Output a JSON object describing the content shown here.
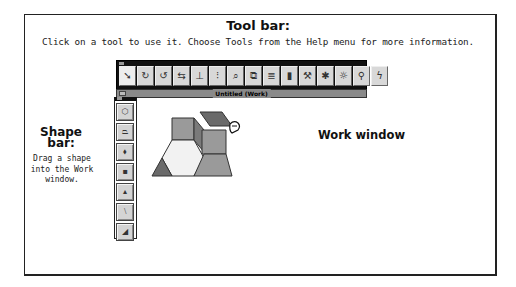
{
  "toolbar_callout": {
    "title": "Tool bar:",
    "description": "Click on a tool to use it.  Choose Tools from the Help menu for more information."
  },
  "toolbar_window": {
    "tools": [
      {
        "name": "arrow-tool",
        "glyph": "➘"
      },
      {
        "name": "rotate-right-tool",
        "glyph": "↻"
      },
      {
        "name": "rotate-left-tool",
        "glyph": "↺"
      },
      {
        "name": "flip-tool",
        "glyph": "⇆"
      },
      {
        "name": "slide-tool",
        "glyph": "⊥"
      },
      {
        "name": "glue-tool",
        "glyph": "⁝"
      },
      {
        "name": "magnify-tool",
        "glyph": "⌕"
      },
      {
        "name": "copy-tool",
        "glyph": "⧉"
      },
      {
        "name": "ruler-tool",
        "glyph": "≣"
      },
      {
        "name": "trash-tool",
        "glyph": "▮"
      },
      {
        "name": "hammer-tool",
        "glyph": "⚒"
      },
      {
        "name": "sparkle-tool",
        "glyph": "✱"
      },
      {
        "name": "sun-tool",
        "glyph": "☼"
      },
      {
        "name": "figure-tool",
        "glyph": "⚲"
      },
      {
        "name": "lightning-tool",
        "glyph": "ϟ"
      }
    ]
  },
  "work_window": {
    "title": "Untitled (Work)",
    "label": "Work window"
  },
  "shapebar_callout": {
    "title": "Shape bar:",
    "description": "Drag a shape into the Work window."
  },
  "shapebar_window": {
    "shapes": [
      {
        "name": "hexagon-shape",
        "glyph": "⬡"
      },
      {
        "name": "trapezoid-shape",
        "glyph": "⏢"
      },
      {
        "name": "diamond-shape",
        "glyph": "⬧"
      },
      {
        "name": "square-shape",
        "glyph": "▪"
      },
      {
        "name": "triangle-shape",
        "glyph": "▴"
      },
      {
        "name": "thin-rhombus-shape",
        "glyph": "⧵"
      },
      {
        "name": "parallelogram-shape",
        "glyph": "◢"
      }
    ]
  },
  "colors": {
    "frame": "#222222",
    "window_title": "#111111",
    "shape_fill_light": "#f2f2f2",
    "shape_fill_mid": "#9a9a9a",
    "shape_fill_dark": "#6a6a6a"
  }
}
